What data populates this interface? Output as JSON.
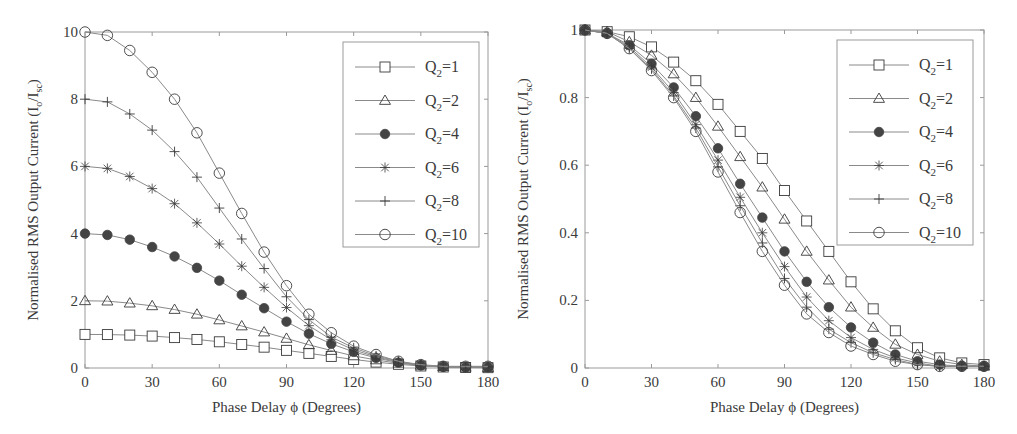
{
  "chart_data": [
    {
      "type": "line",
      "title": "",
      "xlabel": "Phase Delay  ϕ (Degrees)",
      "ylabel": "Normalised RMS Output Current (I",
      "ylabel_sub": "o",
      "ylabel_mid": "/I",
      "ylabel_sub2": "sc",
      "ylabel_end": ")",
      "x": [
        0,
        10,
        20,
        30,
        40,
        50,
        60,
        70,
        80,
        90,
        100,
        110,
        120,
        130,
        140,
        150,
        160,
        170,
        180
      ],
      "xlim": [
        0,
        180
      ],
      "ylim": [
        0,
        10
      ],
      "xticks": [
        0,
        30,
        60,
        90,
        120,
        150,
        180
      ],
      "yticks": [
        0,
        2,
        4,
        6,
        8,
        10
      ],
      "xtick_labels": [
        "0",
        "30",
        "60",
        "90",
        "120",
        "150",
        "180"
      ],
      "ytick_labels": [
        "0",
        "2",
        "4",
        "6",
        "8",
        "10"
      ],
      "grid": false,
      "legend_position": "top-right",
      "series": [
        {
          "name": "Q2=1",
          "label_main": "Q",
          "label_sub": "2",
          "label_val": "=1",
          "marker": "square",
          "values": [
            1.0,
            0.995,
            0.98,
            0.95,
            0.905,
            0.85,
            0.78,
            0.7,
            0.62,
            0.525,
            0.435,
            0.345,
            0.255,
            0.175,
            0.11,
            0.06,
            0.03,
            0.015,
            0.01
          ]
        },
        {
          "name": "Q2=2",
          "label_main": "Q",
          "label_sub": "2",
          "label_val": "=2",
          "marker": "triangle",
          "values": [
            2.0,
            1.99,
            1.93,
            1.85,
            1.74,
            1.6,
            1.43,
            1.25,
            1.07,
            0.88,
            0.69,
            0.52,
            0.36,
            0.24,
            0.14,
            0.08,
            0.04,
            0.02,
            0.01
          ]
        },
        {
          "name": "Q2=4",
          "label_main": "Q",
          "label_sub": "2",
          "label_val": "=4",
          "marker": "filled-circle",
          "values": [
            4.0,
            3.96,
            3.82,
            3.6,
            3.32,
            2.98,
            2.6,
            2.18,
            1.78,
            1.38,
            1.02,
            0.72,
            0.48,
            0.3,
            0.16,
            0.08,
            0.04,
            0.02,
            0.02
          ]
        },
        {
          "name": "Q2=6",
          "label_main": "Q",
          "label_sub": "2",
          "label_val": "=6",
          "marker": "star",
          "values": [
            6.0,
            5.94,
            5.7,
            5.34,
            4.89,
            4.32,
            3.69,
            3.03,
            2.4,
            1.8,
            1.26,
            0.84,
            0.54,
            0.33,
            0.18,
            0.09,
            0.03,
            0.03,
            0.03
          ]
        },
        {
          "name": "Q2=8",
          "label_main": "Q",
          "label_sub": "2",
          "label_val": "=8",
          "marker": "plus",
          "values": [
            8.0,
            7.92,
            7.56,
            7.08,
            6.44,
            5.68,
            4.76,
            3.84,
            2.96,
            2.12,
            1.44,
            0.92,
            0.6,
            0.36,
            0.2,
            0.08,
            0.04,
            0.04,
            0.04
          ]
        },
        {
          "name": "Q2=10",
          "label_main": "Q",
          "label_sub": "2",
          "label_val": "=10",
          "marker": "circle",
          "values": [
            10.0,
            9.9,
            9.45,
            8.8,
            8.0,
            7.0,
            5.8,
            4.6,
            3.45,
            2.45,
            1.6,
            1.05,
            0.65,
            0.4,
            0.2,
            0.1,
            0.05,
            0.05,
            0.05
          ]
        }
      ]
    },
    {
      "type": "line",
      "title": "",
      "xlabel": "Phase Delay  ϕ (Degrees)",
      "ylabel": "Normalised RMS Output Current (I",
      "ylabel_sub": "o",
      "ylabel_mid": "/I",
      "ylabel_sub2": "sc",
      "ylabel_end": ")",
      "x": [
        0,
        10,
        20,
        30,
        40,
        50,
        60,
        70,
        80,
        90,
        100,
        110,
        120,
        130,
        140,
        150,
        160,
        170,
        180
      ],
      "xlim": [
        0,
        180
      ],
      "ylim": [
        0,
        1
      ],
      "xticks": [
        0,
        30,
        60,
        90,
        120,
        150,
        180
      ],
      "yticks": [
        0,
        0.2,
        0.4,
        0.6,
        0.8,
        1
      ],
      "xtick_labels": [
        "0",
        "30",
        "60",
        "90",
        "120",
        "150",
        "180"
      ],
      "ytick_labels": [
        "0",
        "0.2",
        "0.4",
        "0.6",
        "0.8",
        "1"
      ],
      "grid": false,
      "legend_position": "top-right",
      "series": [
        {
          "name": "Q2=1",
          "label_main": "Q",
          "label_sub": "2",
          "label_val": "=1",
          "marker": "square",
          "values": [
            1.0,
            0.995,
            0.98,
            0.95,
            0.905,
            0.85,
            0.78,
            0.7,
            0.62,
            0.525,
            0.435,
            0.345,
            0.255,
            0.175,
            0.11,
            0.06,
            0.03,
            0.015,
            0.01
          ]
        },
        {
          "name": "Q2=2",
          "label_main": "Q",
          "label_sub": "2",
          "label_val": "=2",
          "marker": "triangle",
          "values": [
            1.0,
            0.995,
            0.965,
            0.925,
            0.87,
            0.8,
            0.715,
            0.625,
            0.535,
            0.44,
            0.345,
            0.26,
            0.18,
            0.12,
            0.07,
            0.04,
            0.02,
            0.01,
            0.005
          ]
        },
        {
          "name": "Q2=4",
          "label_main": "Q",
          "label_sub": "2",
          "label_val": "=4",
          "marker": "filled-circle",
          "values": [
            1.0,
            0.99,
            0.955,
            0.9,
            0.83,
            0.745,
            0.65,
            0.545,
            0.445,
            0.345,
            0.255,
            0.18,
            0.12,
            0.075,
            0.04,
            0.02,
            0.01,
            0.005,
            0.005
          ]
        },
        {
          "name": "Q2=6",
          "label_main": "Q",
          "label_sub": "2",
          "label_val": "=6",
          "marker": "star",
          "values": [
            1.0,
            0.99,
            0.95,
            0.89,
            0.815,
            0.72,
            0.615,
            0.505,
            0.4,
            0.3,
            0.21,
            0.14,
            0.09,
            0.055,
            0.03,
            0.015,
            0.005,
            0.005,
            0.005
          ]
        },
        {
          "name": "Q2=8",
          "label_main": "Q",
          "label_sub": "2",
          "label_val": "=8",
          "marker": "plus",
          "values": [
            1.0,
            0.99,
            0.945,
            0.885,
            0.805,
            0.71,
            0.595,
            0.48,
            0.37,
            0.265,
            0.18,
            0.115,
            0.075,
            0.045,
            0.025,
            0.01,
            0.005,
            0.005,
            0.005
          ]
        },
        {
          "name": "Q2=10",
          "label_main": "Q",
          "label_sub": "2",
          "label_val": "=10",
          "marker": "circle",
          "values": [
            1.0,
            0.99,
            0.945,
            0.88,
            0.8,
            0.7,
            0.58,
            0.46,
            0.345,
            0.245,
            0.16,
            0.105,
            0.065,
            0.04,
            0.02,
            0.01,
            0.005,
            0.005,
            0.005
          ]
        }
      ]
    }
  ],
  "colors": {
    "ink": "#3a3a3a",
    "line": "#8a8a8a",
    "frame": "#9a9a9a",
    "marker_fill": "#444444"
  }
}
